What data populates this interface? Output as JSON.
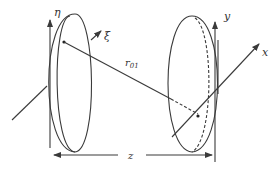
{
  "diagram": {
    "type": "optics-geometry",
    "labels": {
      "eta": "η",
      "xi": "ξ",
      "r01": "r",
      "r01_sub": "01",
      "y": "y",
      "x": "x",
      "z": "z"
    },
    "planes": [
      {
        "name": "aperture-plane",
        "axes": [
          "ξ",
          "η"
        ]
      },
      {
        "name": "observation-plane",
        "axes": [
          "x",
          "y"
        ]
      }
    ],
    "colors": {
      "line": "#3a3a3a",
      "background": "#ffffff"
    }
  }
}
